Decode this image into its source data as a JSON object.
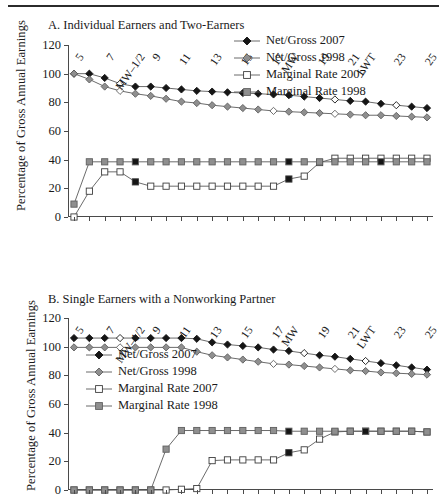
{
  "figure": {
    "ylabel": "Percentage of Gross Annual Earnings",
    "yticks": [
      "0",
      "20",
      "40",
      "60",
      "80",
      "100",
      "120"
    ],
    "xticks": [
      "5",
      "6",
      "7",
      "8",
      "MW–1/2",
      "9",
      "10",
      "11",
      "12",
      "13",
      "14",
      "15",
      "16",
      "17",
      "MW",
      "18",
      "19",
      "20",
      "21",
      "LWT",
      "22",
      "23",
      "24",
      "25"
    ],
    "xticks_visible": [
      "5",
      "7",
      "MW–1/2",
      "9",
      "11",
      "13",
      "15",
      "17",
      "MW",
      "19",
      "21",
      "LWT",
      "23",
      "25"
    ],
    "legend": [
      {
        "label": "Net/Gross 2007",
        "marker": "filled-diamond",
        "color": "#111111"
      },
      {
        "label": "Net/Gross 1998",
        "marker": "grey-diamond",
        "color": "#8c8c8c"
      },
      {
        "label": "Marginal Rate 2007",
        "marker": "open-square",
        "color": "#ffffff"
      },
      {
        "label": "Marginal Rate 1998",
        "marker": "grey-square",
        "color": "#9a9a9a"
      }
    ]
  },
  "chart_data": [
    {
      "type": "line",
      "panel": "A",
      "title": "A. Individual Earners and Two-Earners",
      "xlabel": "",
      "ylabel": "Percentage of Gross Annual Earnings",
      "ylim": [
        0,
        120
      ],
      "grid": false,
      "legend_position": "outside-top-right",
      "categories": [
        "5",
        "6",
        "7",
        "8",
        "MW–1/2",
        "9",
        "10",
        "11",
        "12",
        "13",
        "14",
        "15",
        "16",
        "17",
        "MW",
        "18",
        "19",
        "20",
        "21",
        "LWT",
        "22",
        "23",
        "24",
        "25"
      ],
      "series": [
        {
          "name": "Net/Gross 2007",
          "values": [
            100,
            100,
            97,
            93,
            91,
            91,
            90,
            89,
            88,
            87.5,
            87,
            86.5,
            86,
            85.5,
            85,
            84,
            83,
            82,
            81,
            80.5,
            79,
            78,
            77,
            76
          ]
        },
        {
          "name": "Net/Gross 1998",
          "values": [
            100,
            96,
            91,
            88,
            86,
            84.5,
            82.5,
            80.5,
            79.5,
            78,
            77,
            76,
            75,
            74,
            73.5,
            73,
            72.5,
            72,
            71.5,
            71,
            71,
            70.5,
            70,
            69.5
          ]
        },
        {
          "name": "Marginal Rate 2007",
          "values": [
            0,
            18,
            31.5,
            31.5,
            24.5,
            21.5,
            21.5,
            21.5,
            21.5,
            21.5,
            21.5,
            21.5,
            21.5,
            21.5,
            26.5,
            28.5,
            38,
            41,
            41,
            41,
            41,
            41,
            41,
            41
          ]
        },
        {
          "name": "Marginal Rate 1998",
          "values": [
            9,
            38.5,
            38.5,
            38.5,
            38.5,
            38.5,
            38.5,
            38.5,
            38.5,
            38.5,
            38.5,
            38.5,
            38.5,
            38.5,
            38.5,
            38.5,
            38.5,
            38.5,
            38.5,
            38.5,
            38.5,
            38.5,
            38.5,
            38.5
          ]
        }
      ]
    },
    {
      "type": "line",
      "panel": "B",
      "title": "B. Single Earners with a Nonworking Partner",
      "xlabel": "",
      "ylabel": "Percentage of Gross Annual Earnings",
      "ylim": [
        0,
        120
      ],
      "grid": false,
      "legend_position": "inside-left",
      "categories": [
        "5",
        "6",
        "7",
        "8",
        "MW–1/2",
        "9",
        "10",
        "11",
        "12",
        "13",
        "14",
        "15",
        "16",
        "17",
        "MW",
        "18",
        "19",
        "20",
        "21",
        "LWT",
        "22",
        "23",
        "24",
        "25"
      ],
      "series": [
        {
          "name": "Net/Gross 2007",
          "values": [
            106,
            106,
            106,
            106,
            106,
            106,
            106,
            106,
            105.5,
            103,
            101.5,
            100.5,
            99.5,
            98,
            97,
            95.5,
            94,
            93,
            91.5,
            90,
            88.5,
            87,
            85.5,
            84
          ]
        },
        {
          "name": "Net/Gross 1998",
          "values": [
            99.5,
            99.5,
            99.5,
            99.5,
            99.5,
            99.5,
            99.5,
            99.5,
            96.5,
            94,
            92.5,
            91,
            89.5,
            88,
            87.5,
            86.5,
            85.5,
            84.5,
            83.5,
            83,
            82,
            81.5,
            81,
            80.5
          ]
        },
        {
          "name": "Marginal Rate 2007",
          "values": [
            0,
            0,
            0,
            0,
            0,
            0,
            0,
            0.5,
            1,
            20.5,
            21,
            21,
            21,
            21,
            26,
            28,
            35.5,
            40.5,
            41,
            41,
            41,
            41,
            41,
            40.5
          ]
        },
        {
          "name": "Marginal Rate 1998",
          "values": [
            0,
            0,
            0,
            0,
            0,
            0,
            28.5,
            41.5,
            41.5,
            41.5,
            41.5,
            41.5,
            41.5,
            41.5,
            41,
            41,
            41,
            41,
            41,
            41,
            41,
            41,
            41,
            40.5
          ]
        }
      ]
    }
  ]
}
